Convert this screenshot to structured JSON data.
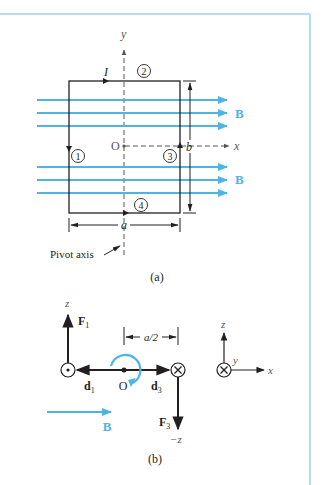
{
  "colors": {
    "frame": "#9fd3ea",
    "field": "#4fb3e3",
    "wire": "#231f20",
    "axis": "#555555"
  },
  "part_a": {
    "caption": "(a)",
    "y_axis_label": "y",
    "x_axis_label": "x",
    "origin_label": "O",
    "current_label": "I",
    "field_label_top": "B",
    "field_label_bottom": "B",
    "width_label": "a",
    "height_label": "b",
    "pivot_label": "Pivot axis",
    "segments": [
      "1",
      "2",
      "3",
      "4"
    ]
  },
  "part_b": {
    "caption": "(b)",
    "z_label": "z",
    "neg_z_label": "−z",
    "force1_main": "F",
    "force1_sub": "1",
    "force3_main": "F",
    "force3_sub": "3",
    "d1_main": "d",
    "d1_sub": "1",
    "d3_main": "d",
    "d3_sub": "3",
    "origin_label": "O",
    "half_width_label": "a/2",
    "field_label": "B",
    "axes_z": "z",
    "axes_y": "y",
    "axes_x": "x"
  }
}
